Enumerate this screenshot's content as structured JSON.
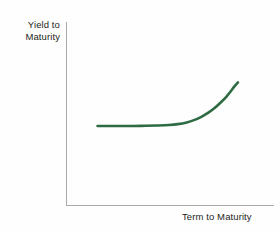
{
  "chart_data": {
    "type": "line",
    "title": "",
    "subtitle": "",
    "xlabel": "Term to Maturity",
    "ylabel": "Yield to Maturity",
    "ylabel_line1": "Yield to",
    "ylabel_line2": "Maturity",
    "grid": false,
    "legend": false,
    "legend_position": "none",
    "axis_ticks": false,
    "tick_labels_x": [],
    "tick_labels_y": [],
    "xlim": [
      0,
      1
    ],
    "ylim": [
      0,
      1
    ],
    "series": [
      {
        "name": "Normal yield curve",
        "color": "#2e6b43",
        "x": [
          0.088,
          0.165,
          0.242,
          0.32,
          0.397,
          0.474,
          0.551,
          0.609,
          0.667,
          0.714,
          0.762,
          0.81,
          0.848,
          0.886,
          0.924,
          0.952,
          0.976,
          1.0
        ],
        "y": [
          0.0,
          0.0,
          0.0,
          0.0,
          0.003,
          0.008,
          0.016,
          0.03,
          0.057,
          0.093,
          0.145,
          0.215,
          0.285,
          0.369,
          0.463,
          0.548,
          0.625,
          0.692
        ],
        "shape": "flat-then-rising"
      }
    ]
  },
  "colors": {
    "curve": "#2e6b43",
    "axis": "#a9a9a9",
    "text": "#231f20",
    "background": "#fefefe"
  }
}
